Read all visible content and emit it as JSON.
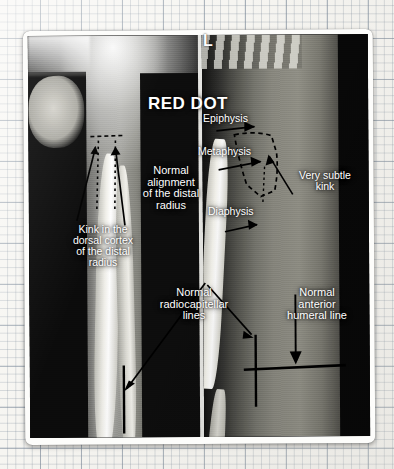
{
  "scene": {
    "medium": "photograph of a printed teaching slide resting on graph paper",
    "background": "graph-paper",
    "photo_border_color": "#fdfdfb"
  },
  "radiograph": {
    "laterality_marker": "L",
    "panels": [
      {
        "name": "ap-view",
        "description": "AP forearm radiograph"
      },
      {
        "name": "lateral-view",
        "description": "Lateral forearm radiograph"
      }
    ]
  },
  "annotations": {
    "headline": "RED DOT",
    "epiphysis": "Epiphysis",
    "metaphysis": "Metaphysis",
    "diaphysis": "Diaphysis",
    "very_subtle_kink": "Very subtle\nkink",
    "normal_alignment": "Normal\nalignment\nof the distal\nradius",
    "kink_dorsal_cortex": "Kink in the\ndorsal cortex\nof the distal\nradius",
    "normal_radiocapitellar": "Normal\nradiocapitellar\nlines",
    "normal_anterior_humeral": "Normal\nanterior\nhumeral line"
  },
  "colors": {
    "annotation_text": "#ffffff",
    "marker_line": "#000000",
    "paper": "#f6f5f1",
    "grid_line": "#7887 96"
  },
  "overlay_graphics": {
    "dashed_outlines": 2,
    "arrows": 7,
    "reference_lines": 3
  }
}
